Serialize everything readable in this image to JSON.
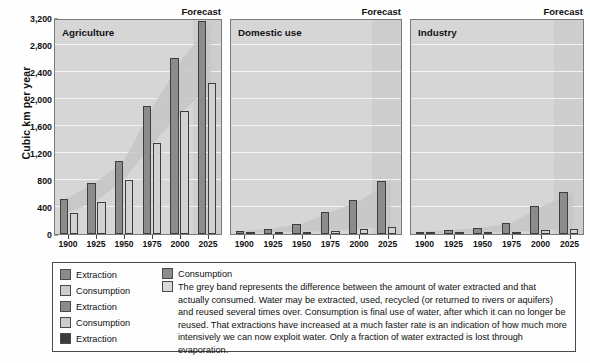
{
  "axis": {
    "y_title": "Cubic km per year",
    "y_ticks": [
      "0",
      "400",
      "800",
      "1,200",
      "1,600",
      "2,000",
      "2,400",
      "2,800",
      "3,200"
    ],
    "x_ticks": [
      "1900",
      "1925",
      "1950",
      "1975",
      "2000",
      "2025"
    ]
  },
  "panels": [
    {
      "title": "Agriculture",
      "forecast_label": "Forecast"
    },
    {
      "title": "Domestic use",
      "forecast_label": "Forecast"
    },
    {
      "title": "Industry",
      "forecast_label": "Forecast"
    }
  ],
  "legend": {
    "left_items": [
      {
        "label": "Extraction",
        "swatch": "extraction"
      },
      {
        "label": "Consumption",
        "swatch": "consumption"
      },
      {
        "label": "Extraction",
        "swatch": "extraction"
      },
      {
        "label": "Consumption",
        "swatch": "consumption"
      },
      {
        "label": "Extraction",
        "swatch": "extraction-dark"
      }
    ],
    "top_right_item": {
      "label": "Consumption",
      "swatch": "extraction"
    },
    "band_item": {
      "swatch": "band",
      "text": "The grey band represents the difference between the amount of water extracted and that actually consumed. Water may be extracted, used, recycled (or returned to rivers or aquifers) and reused several times over. Consumption is final use of water, after which it can no longer be reused. That extractions have increased at a much faster rate is an indication of how much more intensively we can now exploit water. Only a fraction of water extracted is lost through evaporation."
    }
  },
  "colors": {
    "extraction": "#8c8c8c",
    "consumption": "#d2d2d2",
    "extraction_dark": "#3a3a3a",
    "plot_background": "#d6d6d6",
    "forecast_background": "#cdcdcd",
    "gridline": "#f2f2f2",
    "border": "#7a7a7a"
  },
  "chart_data": {
    "type": "bar",
    "xlabel": "",
    "ylabel": "Cubic km per year",
    "ylim": [
      0,
      3200
    ],
    "ytick_step": 400,
    "grid": true,
    "legend_position": "below",
    "categories": [
      "1900",
      "1925",
      "1950",
      "1975",
      "2000",
      "2025"
    ],
    "panels": [
      {
        "name": "Agriculture",
        "forecast_from": "2025",
        "series": [
          {
            "name": "Extraction",
            "values": [
              520,
              760,
              1080,
              1900,
              2610,
              3150
            ]
          },
          {
            "name": "Consumption",
            "values": [
              310,
              470,
              800,
              1350,
              1820,
              2230
            ]
          }
        ]
      },
      {
        "name": "Domestic use",
        "forecast_from": "2025",
        "series": [
          {
            "name": "Extraction",
            "values": [
              40,
              80,
              150,
              330,
              510,
              790
            ]
          },
          {
            "name": "Consumption",
            "values": [
              15,
              25,
              35,
              45,
              80,
              110
            ]
          }
        ]
      },
      {
        "name": "Industry",
        "forecast_from": "2025",
        "series": [
          {
            "name": "Extraction",
            "values": [
              30,
              65,
              90,
              170,
              420,
              620
            ]
          },
          {
            "name": "Consumption",
            "values": [
              10,
              12,
              18,
              30,
              55,
              75
            ]
          }
        ]
      }
    ]
  }
}
